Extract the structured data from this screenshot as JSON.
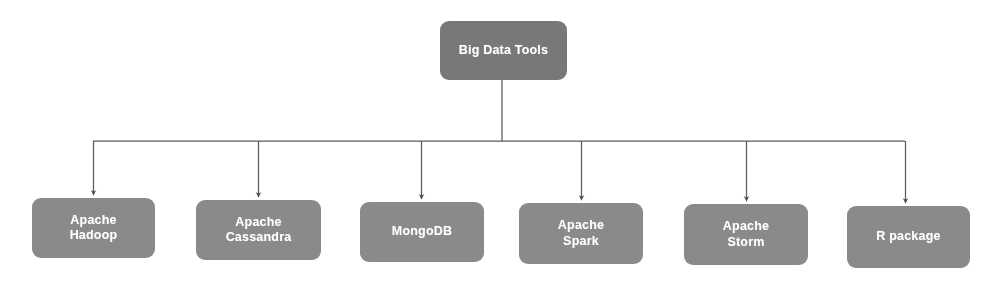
{
  "diagram": {
    "title": "Big Data Tools",
    "root": {
      "label": "Big Data Tools",
      "color": "#787878",
      "x": 440,
      "y": 21,
      "w": 127,
      "h": 59
    },
    "leaf_color": "#8a8a8a",
    "connector_color": "#555555",
    "background": "#ffffff",
    "bus_y": 141,
    "leaves": [
      {
        "label": "Apache\nHadoop",
        "x": 32,
        "y": 198,
        "w": 123,
        "h": 60
      },
      {
        "label": "Apache\nCassandra",
        "x": 196,
        "y": 200,
        "w": 125,
        "h": 60
      },
      {
        "label": "MongoDB",
        "x": 360,
        "y": 202,
        "w": 124,
        "h": 60
      },
      {
        "label": "Apache\nSpark",
        "x": 519,
        "y": 203,
        "w": 124,
        "h": 61
      },
      {
        "label": "Apache\nStorm",
        "x": 684,
        "y": 204,
        "w": 124,
        "h": 61
      },
      {
        "label": "R package",
        "x": 847,
        "y": 206,
        "w": 123,
        "h": 62
      }
    ]
  }
}
